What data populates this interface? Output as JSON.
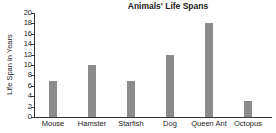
{
  "chart_data": {
    "type": "bar",
    "title": "Animals' Life Spans",
    "xlabel": "",
    "ylabel": "Life Span in Years",
    "categories": [
      "Mouse",
      "Hamster",
      "Starfish",
      "Dog",
      "Queen Ant",
      "Octopus"
    ],
    "values": [
      7,
      10,
      7,
      12,
      18,
      3
    ],
    "ylim": [
      0,
      20
    ],
    "yticks": [
      0,
      2,
      4,
      6,
      8,
      10,
      12,
      14,
      16,
      18,
      20
    ],
    "grid": false,
    "legend": null,
    "bar_color": "#8c8c8c"
  }
}
